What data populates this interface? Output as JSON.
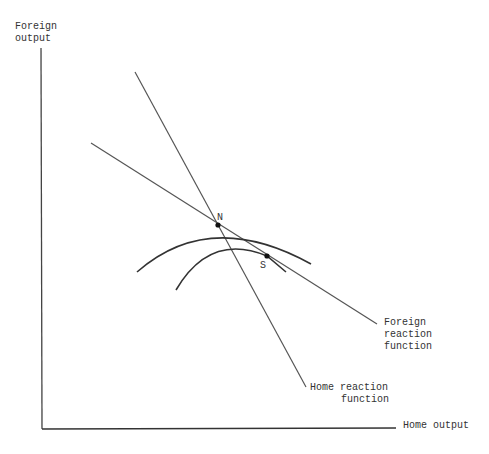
{
  "diagram": {
    "axes": {
      "y_label": [
        "Foreign",
        "output"
      ],
      "x_label": "Home output"
    },
    "lines": {
      "home_reaction": {
        "label": [
          "Home reaction",
          "function"
        ]
      },
      "foreign_reaction": {
        "label": [
          "Foreign",
          "reaction",
          "function"
        ]
      }
    },
    "points": {
      "nash": "N",
      "stackelberg": "S"
    },
    "colors": {
      "ink": "#333333",
      "background": "#ffffff"
    }
  }
}
